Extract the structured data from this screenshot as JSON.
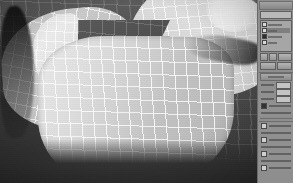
{
  "app": {
    "kind": "3d-modeling-viewport",
    "title": "",
    "viewport": {
      "shading": "smooth-and-highlights-with-wireframe",
      "background_color": "#4e4e4e",
      "wireframe_color": "#ffffff",
      "surface_color": "#cfcfcf",
      "subject": "organic quad-mesh surface with V-shaped notch"
    }
  },
  "panel": {
    "name": "command-panel",
    "modifier_name_field_value": "",
    "stack": {
      "label": "",
      "items": [
        {
          "label": "",
          "selected": false,
          "toggle_on": false
        },
        {
          "label": "",
          "selected": true,
          "toggle_on": false
        },
        {
          "label": "",
          "selected": false,
          "toggle_on": true
        },
        {
          "label": "",
          "selected": false,
          "toggle_on": false
        }
      ]
    },
    "stack_buttons": [
      {
        "label": "",
        "name": "pin-stack-button"
      },
      {
        "label": "",
        "name": "show-end-result-button"
      },
      {
        "label": "",
        "name": "make-unique-button"
      },
      {
        "label": "",
        "name": "remove-modifier-button"
      },
      {
        "label": "",
        "name": "configure-sets-button"
      }
    ],
    "rollouts": [
      {
        "header": "",
        "name": "parameters-rollout",
        "rows": [
          {
            "type": "field",
            "label": "",
            "value": ""
          },
          {
            "type": "field",
            "label": "",
            "value": ""
          },
          {
            "type": "field",
            "label": "",
            "value": ""
          },
          {
            "type": "check",
            "label": "",
            "checked": true
          },
          {
            "type": "label",
            "label": ""
          }
        ]
      },
      {
        "header": "",
        "name": "options-rollout",
        "rows": [
          {
            "type": "check",
            "label": "",
            "checked": false
          },
          {
            "type": "label",
            "label": ""
          },
          {
            "type": "check",
            "label": "",
            "checked": false
          },
          {
            "type": "label",
            "label": ""
          },
          {
            "type": "check",
            "label": "",
            "checked": false
          },
          {
            "type": "label",
            "label": ""
          },
          {
            "type": "check",
            "label": "",
            "checked": false
          }
        ]
      }
    ]
  },
  "colors": {
    "panel_bg": "#8e8e8e",
    "viewport_bg": "#4e4e4e",
    "wire": "#ffffff",
    "border": "#ffffff"
  }
}
